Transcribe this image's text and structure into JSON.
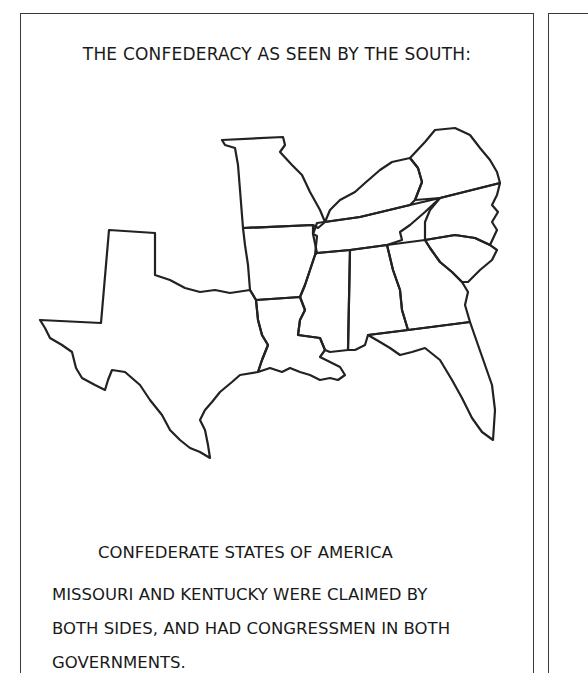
{
  "page": {
    "title": "THE CONFEDERACY AS SEEN BY THE SOUTH:",
    "caption": "CONFEDERATE STATES OF AMERICA",
    "note_lines": [
      "MISSOURI AND KENTUCKY WERE CLAIMED BY",
      "BOTH SIDES, AND HAD CONGRESSMEN IN BOTH",
      "GOVERNMENTS."
    ]
  },
  "map": {
    "description": "Outline map of southern U.S. states (unlabeled)",
    "regions": [
      "texas",
      "missouri",
      "arkansas",
      "louisiana",
      "mississippi",
      "alabama",
      "georgia",
      "florida",
      "tennessee",
      "kentucky",
      "virginia",
      "north-carolina",
      "south-carolina"
    ],
    "stroke_color": "#222222",
    "background_color": "#ffffff"
  }
}
